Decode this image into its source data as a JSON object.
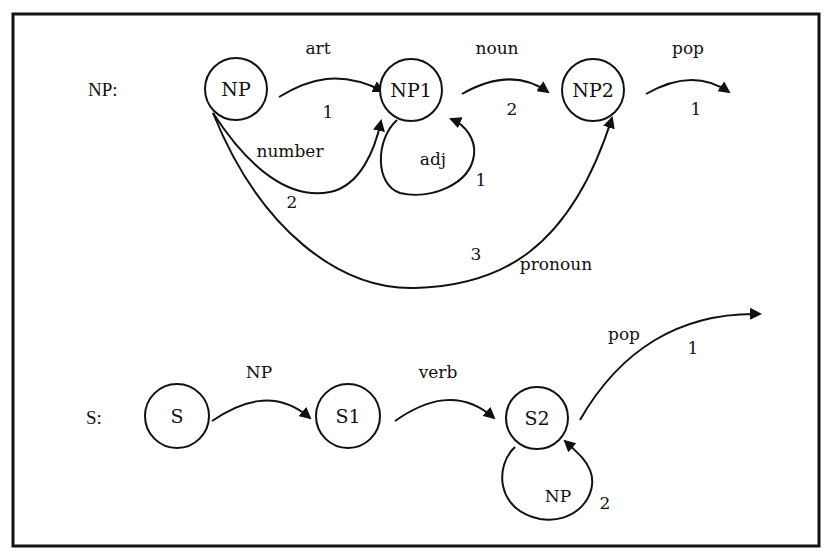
{
  "diagram": {
    "frame": {
      "border_color": "#111111",
      "background": "#ffffff"
    },
    "networks": [
      {
        "name": "NP:",
        "nodes": [
          "NP",
          "NP1",
          "NP2"
        ],
        "arcs": [
          {
            "from": "NP",
            "to": "NP1",
            "label": "art",
            "order": "1"
          },
          {
            "from": "NP",
            "to": "NP1",
            "label": "number",
            "order": "2"
          },
          {
            "from": "NP",
            "to": "NP2",
            "label": "pronoun",
            "order": "3"
          },
          {
            "from": "NP1",
            "to": "NP1",
            "label": "adj",
            "order": "1"
          },
          {
            "from": "NP1",
            "to": "NP2",
            "label": "noun",
            "order": "2"
          },
          {
            "from": "NP2",
            "to": "exit",
            "label": "pop",
            "order": "1"
          }
        ]
      },
      {
        "name": "S:",
        "nodes": [
          "S",
          "S1",
          "S2"
        ],
        "arcs": [
          {
            "from": "S",
            "to": "S1",
            "label": "NP",
            "order": ""
          },
          {
            "from": "S1",
            "to": "S2",
            "label": "verb",
            "order": ""
          },
          {
            "from": "S2",
            "to": "exit",
            "label": "pop",
            "order": "1"
          },
          {
            "from": "S2",
            "to": "S2",
            "label": "NP",
            "order": "2"
          }
        ]
      }
    ]
  }
}
